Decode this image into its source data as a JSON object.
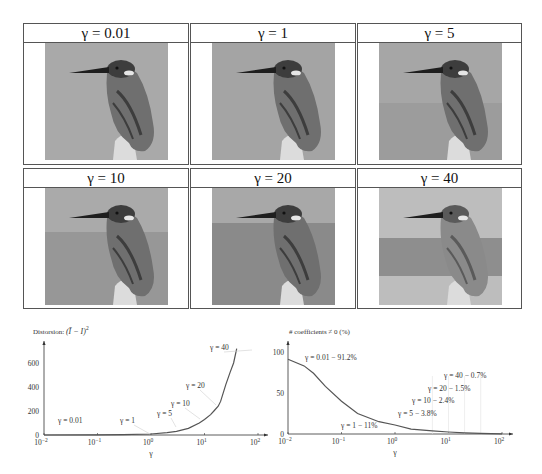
{
  "panels": [
    {
      "label": "γ = 0.01",
      "gamma": "0.01",
      "bg_top": "#a9a9a9",
      "bg_bottom": "#a9a9a9",
      "band": null
    },
    {
      "label": "γ = 1",
      "gamma": "1",
      "bg_top": "#a4a4a4",
      "bg_bottom": "#a4a4a4",
      "band": null
    },
    {
      "label": "γ = 5",
      "gamma": "5",
      "bg_top": "#a6a6a6",
      "bg_bottom": "#9c9c9c",
      "band": null
    },
    {
      "label": "γ = 10",
      "gamma": "10",
      "bg_top": "#aaaaaa",
      "bg_bottom": "#979797",
      "band": 0.38
    },
    {
      "label": "γ = 20",
      "gamma": "20",
      "bg_top": "#a8a8a8",
      "bg_bottom": "#8a8a8a",
      "band": 0.3
    },
    {
      "label": "γ = 40",
      "gamma": "40",
      "bg_top": "#bdbdbd",
      "bg_bottom": "#bdbdbd",
      "band": 0.45
    }
  ],
  "chart_data": [
    {
      "type": "line",
      "title": "Distorsion: (Ī − I)²",
      "title_prefix": "Distorsion:",
      "xlabel": "γ",
      "ylabel": "Distorsion: (Ī − I)²",
      "xscale": "log",
      "xlim": [
        0.01,
        100
      ],
      "ylim": [
        0,
        750
      ],
      "x_ticks": [
        "10⁻²",
        "10⁻¹",
        "10⁰",
        "10¹",
        "10²"
      ],
      "y_ticks": [
        "0",
        "200",
        "400",
        "600"
      ],
      "grid": false,
      "x": [
        0.01,
        0.1,
        0.3,
        1,
        2,
        3,
        5,
        8,
        10,
        13,
        15,
        18,
        20,
        25,
        30,
        35,
        40
      ],
      "values": [
        0,
        1,
        3,
        8,
        20,
        30,
        55,
        100,
        130,
        170,
        200,
        240,
        280,
        420,
        520,
        600,
        720
      ],
      "annotations": [
        {
          "text": "γ = 0.01",
          "x": 0.01,
          "y": 0
        },
        {
          "text": "γ = 1",
          "x": 1,
          "y": 8
        },
        {
          "text": "γ = 5",
          "x": 5,
          "y": 55
        },
        {
          "text": "γ = 10",
          "x": 10,
          "y": 130
        },
        {
          "text": "γ = 20",
          "x": 20,
          "y": 280
        },
        {
          "text": "γ = 40",
          "x": 40,
          "y": 720
        }
      ]
    },
    {
      "type": "line",
      "title": "# coefficients ≠ 0  (%)",
      "xlabel": "γ",
      "ylabel": "# coefficients ≠ 0 (%)",
      "xscale": "log",
      "xlim": [
        0.01,
        100
      ],
      "ylim": [
        0,
        100
      ],
      "x_ticks": [
        "10⁻²",
        "10⁻¹",
        "10⁰",
        "10¹",
        "10²"
      ],
      "y_ticks": [
        "0",
        "50",
        "100"
      ],
      "grid": false,
      "x": [
        0.01,
        0.02,
        0.03,
        0.05,
        0.1,
        0.2,
        0.5,
        1,
        2,
        5,
        10,
        20,
        40,
        100
      ],
      "values": [
        91.2,
        83,
        74,
        58,
        40,
        25,
        15,
        11,
        6,
        3.8,
        2.4,
        1.5,
        0.7,
        0.2
      ],
      "annotations": [
        {
          "text": "γ = 0.01 − 91.2%",
          "x": 0.01,
          "y": 91.2
        },
        {
          "text": "γ = 1 − 11%",
          "x": 1,
          "y": 11
        },
        {
          "text": "γ = 5 − 3.8%",
          "x": 5,
          "y": 3.8
        },
        {
          "text": "γ = 10 − 2.4%",
          "x": 10,
          "y": 2.4
        },
        {
          "text": "γ = 20 − 1.5%",
          "x": 20,
          "y": 1.5
        },
        {
          "text": "γ = 40 − 0.7%",
          "x": 40,
          "y": 0.7
        }
      ]
    }
  ],
  "charts": {
    "left": {
      "ylabel": "Distorsion:",
      "ylabel_math": "(Ī − I)",
      "ylabel_sup": "2",
      "xlabel": "γ",
      "ticks_x": [
        "10",
        "10",
        "10",
        "10",
        "10"
      ],
      "ticks_x_exp": [
        "−2",
        "−1",
        "0",
        "1",
        "2"
      ],
      "ticks_y": [
        "0",
        "200",
        "400",
        "600"
      ],
      "ann": [
        "γ = 0.01",
        "γ = 1",
        "γ = 5",
        "γ = 10",
        "γ = 20",
        "γ = 40"
      ]
    },
    "right": {
      "ylabel": "# coefficients ≠ 0  (%)",
      "xlabel": "γ",
      "ticks_x": [
        "10",
        "10",
        "10",
        "10",
        "10"
      ],
      "ticks_x_exp": [
        "−2",
        "−1",
        "0",
        "1",
        "2"
      ],
      "ticks_y": [
        "0",
        "50",
        "100"
      ],
      "ann": [
        "γ = 0.01 − 91.2%",
        "γ = 1 − 11%",
        "γ = 5 − 3.8%",
        "γ = 10 − 2.4%",
        "γ = 20 − 1.5%",
        "γ = 40 − 0.7%"
      ]
    },
    "line_color": "#555555",
    "axis_color": "#333333",
    "text_color": "#333333"
  }
}
